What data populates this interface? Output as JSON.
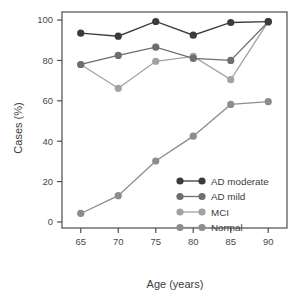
{
  "chart_data": {
    "type": "line",
    "title": "",
    "xlabel": "Age (years)",
    "ylabel": "Cases (%)",
    "x": [
      65,
      70,
      75,
      80,
      85,
      90
    ],
    "xticks": [
      "65",
      "70",
      "75",
      "80",
      "85",
      "90"
    ],
    "yticks": [
      "0",
      "20",
      "40",
      "60",
      "80",
      "100"
    ],
    "xlim": [
      62.5,
      92.5
    ],
    "ylim": [
      -3,
      104
    ],
    "grid": false,
    "legend_position": "bottom-right",
    "series": [
      {
        "name": "AD moderate",
        "color": "#3b3b3b",
        "values": [
          93.5,
          92.0,
          99.3,
          92.5,
          98.8,
          99.2
        ]
      },
      {
        "name": "AD mild",
        "color": "#6e6e6e",
        "values": [
          78.0,
          82.5,
          86.6,
          81.0,
          80.0,
          99.2
        ]
      },
      {
        "name": "MCI",
        "color": "#a2a2a2",
        "values": [
          78.0,
          66.2,
          79.6,
          82.0,
          70.5,
          99.2
        ]
      },
      {
        "name": "Normal",
        "color": "#8c8c8c",
        "values": [
          4.2,
          13.0,
          30.2,
          42.5,
          58.2,
          59.6
        ]
      }
    ]
  },
  "legend": {
    "items": [
      {
        "label": "AD moderate",
        "color": "#3b3b3b"
      },
      {
        "label": "AD mild",
        "color": "#6e6e6e"
      },
      {
        "label": "MCI",
        "color": "#a2a2a2"
      },
      {
        "label": "Normal",
        "color": "#8c8c8c"
      }
    ]
  },
  "axes": {
    "x_title": "Age (years)",
    "y_title": "Cases (%)",
    "frame_color": "#4d4d4d"
  }
}
